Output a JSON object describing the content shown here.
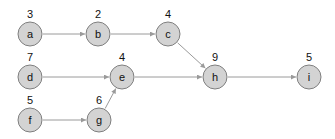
{
  "diagram": {
    "type": "directed-graph",
    "colors": {
      "node_fill": "#d3d3d3",
      "node_stroke": "#7f7f7f",
      "edge": "#9a9a9a",
      "text": "#111111"
    },
    "nodes": [
      {
        "id": "a",
        "label": "a",
        "weight": "3",
        "x": 30,
        "y": 34
      },
      {
        "id": "b",
        "label": "b",
        "weight": "2",
        "x": 98,
        "y": 34
      },
      {
        "id": "c",
        "label": "c",
        "weight": "4",
        "x": 168,
        "y": 34
      },
      {
        "id": "d",
        "label": "d",
        "weight": "7",
        "x": 30,
        "y": 77
      },
      {
        "id": "e",
        "label": "e",
        "weight": "4",
        "x": 122,
        "y": 77
      },
      {
        "id": "f",
        "label": "f",
        "weight": "5",
        "x": 30,
        "y": 120
      },
      {
        "id": "g",
        "label": "g",
        "weight": "6",
        "x": 99,
        "y": 120
      },
      {
        "id": "h",
        "label": "h",
        "weight": "9",
        "x": 215,
        "y": 77
      },
      {
        "id": "i",
        "label": "i",
        "weight": "5",
        "x": 309,
        "y": 77
      }
    ],
    "edges": [
      {
        "from": "a",
        "to": "b"
      },
      {
        "from": "b",
        "to": "c"
      },
      {
        "from": "c",
        "to": "h"
      },
      {
        "from": "d",
        "to": "e"
      },
      {
        "from": "e",
        "to": "h"
      },
      {
        "from": "f",
        "to": "g"
      },
      {
        "from": "g",
        "to": "e"
      },
      {
        "from": "h",
        "to": "i"
      }
    ]
  }
}
